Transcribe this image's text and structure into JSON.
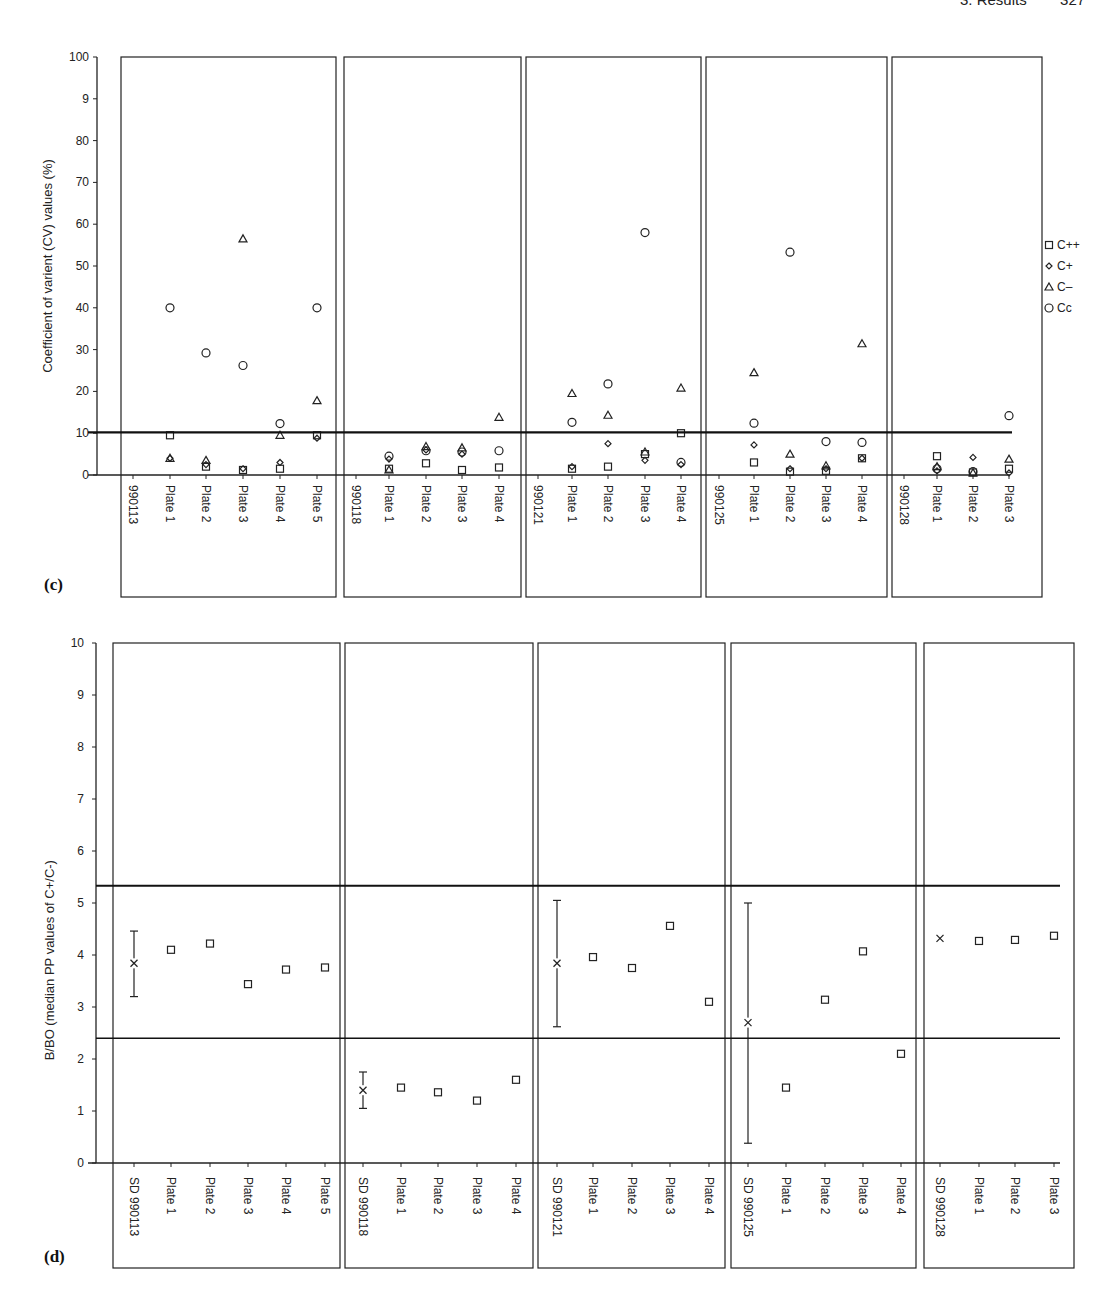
{
  "page_header": "3. Results        327",
  "chart_data": [
    {
      "id": "c",
      "panel_label": "(c)",
      "type": "scatter",
      "ylabel": "Coefficient of varient (CV) values (%)",
      "ylim": [
        0,
        100
      ],
      "yticks": [
        "0",
        "10",
        "20",
        "30",
        "40",
        "50",
        "60",
        "70",
        "80",
        "9",
        "100"
      ],
      "threshold_line": 10.2,
      "legend": {
        "position": "right",
        "entries": [
          {
            "key": "Cpp",
            "label": "C++",
            "marker": "square"
          },
          {
            "key": "Cp",
            "label": "C+",
            "marker": "diamond"
          },
          {
            "key": "Cm",
            "label": "C–",
            "marker": "triangle"
          },
          {
            "key": "Cc",
            "label": "Cc",
            "marker": "circle"
          }
        ]
      },
      "groups": [
        {
          "name": "990113",
          "categories": [
            "990113",
            "Plate 1",
            "Plate 2",
            "Plate 3",
            "Plate 4",
            "Plate 5"
          ],
          "points": {
            "Plate 1": {
              "Cpp": 9.5,
              "Cp": 4,
              "Cm": 4,
              "Cc": 40
            },
            "Plate 2": {
              "Cpp": 2,
              "Cp": 2.5,
              "Cm": 3.5,
              "Cc": 29.2
            },
            "Plate 3": {
              "Cpp": 1.2,
              "Cp": 1.5,
              "Cm": 56.5,
              "Cc": 26.2
            },
            "Plate 4": {
              "Cpp": 1.5,
              "Cp": 3,
              "Cm": 9.5,
              "Cc": 12.3
            },
            "Plate 5": {
              "Cpp": 9.5,
              "Cp": 8.8,
              "Cm": 17.8,
              "Cc": 40
            }
          }
        },
        {
          "name": "990118",
          "categories": [
            "990118",
            "Plate 1",
            "Plate 2",
            "Plate 3",
            "Plate 4"
          ],
          "points": {
            "Plate 1": {
              "Cpp": 1.5,
              "Cp": 3.8,
              "Cm": 1.2,
              "Cc": 4.5
            },
            "Plate 2": {
              "Cpp": 2.8,
              "Cp": 6,
              "Cm": 6.8,
              "Cc": 5.8
            },
            "Plate 3": {
              "Cpp": 1.2,
              "Cp": 5,
              "Cm": 6.5,
              "Cc": 5.5
            },
            "Plate 4": {
              "Cpp": 1.8,
              "Cp": null,
              "Cm": 13.8,
              "Cc": 5.8
            }
          }
        },
        {
          "name": "990121",
          "categories": [
            "990121",
            "Plate 1",
            "Plate 2",
            "Plate 3",
            "Plate 4"
          ],
          "points": {
            "Plate 1": {
              "Cpp": 1.5,
              "Cp": 2,
              "Cm": 19.5,
              "Cc": 12.6
            },
            "Plate 2": {
              "Cpp": 2,
              "Cp": 7.5,
              "Cm": 14.3,
              "Cc": 21.8
            },
            "Plate 3": {
              "Cpp": 5,
              "Cp": 3.5,
              "Cm": 5.5,
              "Cc": 58
            },
            "Plate 4": {
              "Cpp": 10,
              "Cp": 2.5,
              "Cm": 20.8,
              "Cc": 3
            }
          }
        },
        {
          "name": "990125",
          "categories": [
            "990125",
            "Plate 1",
            "Plate 2",
            "Plate 3",
            "Plate 4"
          ],
          "points": {
            "Plate 1": {
              "Cpp": 3,
              "Cp": 7.2,
              "Cm": 24.5,
              "Cc": 12.4
            },
            "Plate 2": {
              "Cpp": 0.8,
              "Cp": 1.5,
              "Cm": 5,
              "Cc": 53.3
            },
            "Plate 3": {
              "Cpp": 1,
              "Cp": 1.5,
              "Cm": 2.2,
              "Cc": 8
            },
            "Plate 4": {
              "Cpp": 4,
              "Cp": 4,
              "Cm": 31.4,
              "Cc": 7.8
            }
          }
        },
        {
          "name": "990128",
          "categories": [
            "990128",
            "Plate 1",
            "Plate 2",
            "Plate 3"
          ],
          "points": {
            "Plate 1": {
              "Cpp": 4.5,
              "Cp": 1,
              "Cm": 2,
              "Cc": 1.5
            },
            "Plate 2": {
              "Cpp": 0.6,
              "Cp": 4.2,
              "Cm": 0.5,
              "Cc": 0.8
            },
            "Plate 3": {
              "Cpp": 1.5,
              "Cp": 0.5,
              "Cm": 3.8,
              "Cc": 14.2
            }
          }
        }
      ]
    },
    {
      "id": "d",
      "panel_label": "(d)",
      "type": "scatter",
      "ylabel": "B/BO (median PP values of C+/C-)",
      "ylim": [
        0,
        10
      ],
      "yticks": [
        "0",
        "1",
        "2",
        "3",
        "4",
        "5",
        "6",
        "7",
        "8",
        "9",
        "10"
      ],
      "upper_line": 5.33,
      "lower_line": 2.4,
      "groups": [
        {
          "name": "990113",
          "sd": {
            "label": "SD 990113",
            "mean": 3.84,
            "low": 3.2,
            "high": 4.46
          },
          "plates": [
            {
              "label": "Plate 1",
              "value": 4.1
            },
            {
              "label": "Plate 2",
              "value": 4.22
            },
            {
              "label": "Plate 3",
              "value": 3.44
            },
            {
              "label": "Plate 4",
              "value": 3.72
            },
            {
              "label": "Plate 5",
              "value": 3.76
            }
          ]
        },
        {
          "name": "990118",
          "sd": {
            "label": "SD 990118",
            "mean": 1.4,
            "low": 1.05,
            "high": 1.75
          },
          "plates": [
            {
              "label": "Plate 1",
              "value": 1.45
            },
            {
              "label": "Plate 2",
              "value": 1.36
            },
            {
              "label": "Plate 3",
              "value": 1.2
            },
            {
              "label": "Plate 4",
              "value": 1.6
            }
          ]
        },
        {
          "name": "990121",
          "sd": {
            "label": "SD 990121",
            "mean": 3.84,
            "low": 2.62,
            "high": 5.05
          },
          "plates": [
            {
              "label": "Plate 1",
              "value": 3.96
            },
            {
              "label": "Plate 2",
              "value": 3.75
            },
            {
              "label": "Plate 3",
              "value": 4.56
            },
            {
              "label": "Plate 4",
              "value": 3.1
            }
          ]
        },
        {
          "name": "990125",
          "sd": {
            "label": "SD 990125",
            "mean": 2.7,
            "low": 0.38,
            "high": 5.0
          },
          "plates": [
            {
              "label": "Plate 1",
              "value": 1.45
            },
            {
              "label": "Plate 2",
              "value": 3.14
            },
            {
              "label": "Plate 3",
              "value": 4.07
            },
            {
              "label": "Plate 4",
              "value": 2.1
            }
          ]
        },
        {
          "name": "990128",
          "sd": {
            "label": "SD 990128",
            "mean": 4.32,
            "low": 4.32,
            "high": 4.38
          },
          "plates": [
            {
              "label": "Plate 1",
              "value": 4.27
            },
            {
              "label": "Plate 2",
              "value": 4.29
            },
            {
              "label": "Plate 3",
              "value": 4.37
            }
          ]
        }
      ]
    }
  ]
}
